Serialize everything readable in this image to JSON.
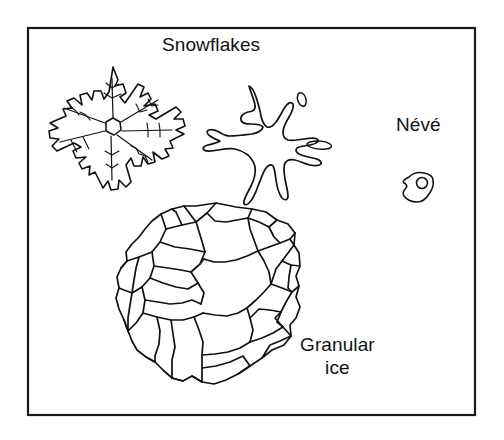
{
  "figure": {
    "title_caption": "Snowflakes",
    "background_color": "#ffffff",
    "ink_color": "#111111",
    "border_color": "#1a1a1a",
    "width": 504,
    "height": 440
  },
  "frame": {
    "x": 27,
    "y": 27,
    "width": 448,
    "height": 388,
    "stroke_width": 2
  },
  "labels": {
    "snowflakes": "Snowflakes",
    "neve": "Névé",
    "granular_line1": "Granular",
    "granular_line2": "ice"
  },
  "objects": [
    {
      "name": "dendritic-snowflake",
      "label": "Snowflakes",
      "arms": 6,
      "style": "dendritic stellar crystal with jagged lobed branches",
      "center": [
        113,
        128
      ],
      "radius": 62
    },
    {
      "name": "rounded-snowflake",
      "label": "Snowflakes",
      "arms": 6,
      "style": "partly rounded stellar crystal with blobby arms",
      "center": [
        268,
        133
      ],
      "radius": 52,
      "detached_fragments": 2
    },
    {
      "name": "neve-grain",
      "label": "Névé",
      "style": "single rounded irregular grain with internal pore",
      "center": [
        418,
        188
      ],
      "radius": 16
    },
    {
      "name": "granular-ice-aggregate",
      "label": "Granular ice",
      "style": "polycrystalline mass of packed polygonal grains",
      "grain_count": 26,
      "center": [
        212,
        295
      ],
      "radius": 98
    }
  ]
}
